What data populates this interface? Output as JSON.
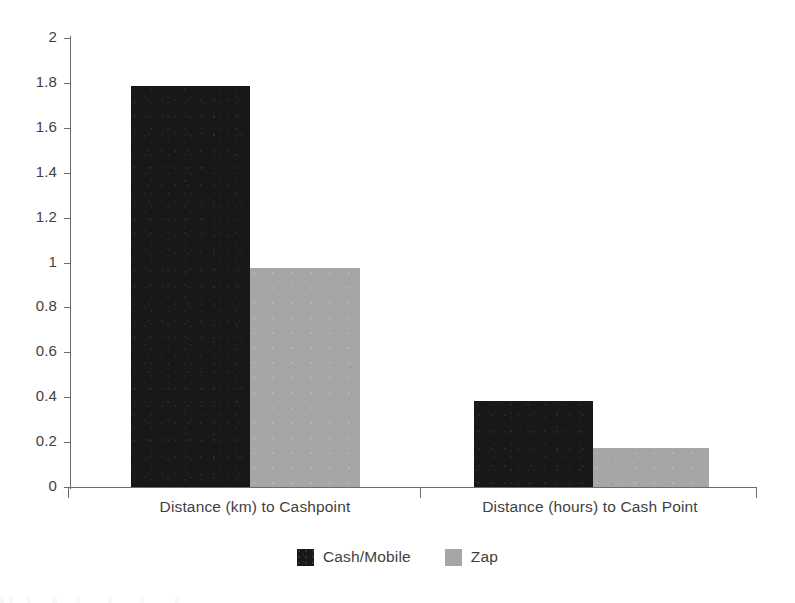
{
  "chart_data": {
    "type": "bar",
    "title": "",
    "xlabel": "",
    "ylabel": "",
    "categories": [
      "Distance (km) to Cashpoint",
      "Distance (hours) to Cash Point"
    ],
    "series": [
      {
        "name": "Cash/Mobile",
        "color": "#181818",
        "values": [
          1.785,
          0.385
        ]
      },
      {
        "name": "Zap",
        "color": "#a6a6a6",
        "values": [
          0.975,
          0.175
        ]
      }
    ],
    "ylim": [
      0,
      2
    ],
    "ytick_step": 0.2,
    "ytick_labels": [
      "0",
      "0.2",
      "0.4",
      "0.6",
      "0.8",
      "1",
      "1.2",
      "1.4",
      "1.6",
      "1.8",
      "2"
    ],
    "grid": false,
    "legend_position": "bottom"
  },
  "axis": {
    "line_color": "#6b6b6b",
    "text_color": "#3f3f3f"
  }
}
